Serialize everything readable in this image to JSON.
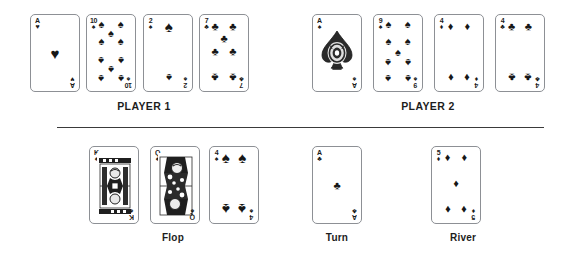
{
  "scene": {
    "title": "Texas Hold'em showdown board",
    "background_color": "#ffffff",
    "ink_color": "#171717",
    "card_border_color": "#8d9095"
  },
  "sections": {
    "player1_label": "PLAYER 1",
    "player2_label": "PLAYER 2",
    "flop_label": "Flop",
    "turn_label": "Turn",
    "river_label": "River"
  },
  "hands": {
    "player1": [
      {
        "rank": "A",
        "suit": "hearts",
        "suit_glyph": "♥",
        "index_suit_glyph": "♥",
        "pip_count": 1,
        "label": "Ace of Hearts"
      },
      {
        "rank": "10",
        "suit": "spades",
        "suit_glyph": "♠",
        "index_suit_glyph": "♠",
        "pip_count": 10,
        "label": "Ten of Spades"
      },
      {
        "rank": "2",
        "suit": "spades",
        "suit_glyph": "♠",
        "index_suit_glyph": "♠",
        "pip_count": 2,
        "label": "Two of Spades"
      },
      {
        "rank": "7",
        "suit": "clubs",
        "suit_glyph": "♣",
        "index_suit_glyph": "♣",
        "pip_count": 7,
        "label": "Seven of Clubs"
      }
    ],
    "player2": [
      {
        "rank": "A",
        "suit": "spades",
        "suit_glyph": "♠",
        "index_suit_glyph": "♠",
        "pip_count": 1,
        "label": "Ace of Spades",
        "ornate": true
      },
      {
        "rank": "9",
        "suit": "spades",
        "suit_glyph": "♠",
        "index_suit_glyph": "♠",
        "pip_count": 9,
        "label": "Nine of Spades"
      },
      {
        "rank": "4",
        "suit": "diamonds",
        "suit_glyph": "♦",
        "index_suit_glyph": "♦",
        "pip_count": 4,
        "label": "Four of Diamonds"
      },
      {
        "rank": "4",
        "suit": "clubs",
        "suit_glyph": "♣",
        "index_suit_glyph": "♣",
        "pip_count": 4,
        "label": "Four of Clubs"
      }
    ]
  },
  "community": {
    "flop": [
      {
        "rank": "K",
        "suit": "spades",
        "suit_glyph": "♠",
        "index_suit_glyph": "♠",
        "court": true,
        "label": "King of Spades"
      },
      {
        "rank": "Q",
        "suit": "spades",
        "suit_glyph": "♠",
        "index_suit_glyph": "♠",
        "court": true,
        "label": "Queen of Spades"
      },
      {
        "rank": "4",
        "suit": "spades",
        "suit_glyph": "♠",
        "index_suit_glyph": "♠",
        "pip_count": 4,
        "label": "Four of Spades"
      }
    ],
    "turn": [
      {
        "rank": "A",
        "suit": "clubs",
        "suit_glyph": "♣",
        "index_suit_glyph": "♣",
        "pip_count": 1,
        "label": "Ace of Clubs"
      }
    ],
    "river": [
      {
        "rank": "5",
        "suit": "diamonds",
        "suit_glyph": "♦",
        "index_suit_glyph": "♦",
        "pip_count": 5,
        "label": "Five of Diamonds"
      }
    ]
  }
}
